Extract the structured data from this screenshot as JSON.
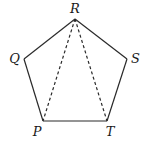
{
  "figure": {
    "type": "pentagon-diagram",
    "stroke_color": "#2a2a2a",
    "vertices": [
      {
        "label": "R",
        "x": 75,
        "y": 19,
        "lx": 75,
        "ly": 13,
        "anchor": "middle"
      },
      {
        "label": "S",
        "x": 127,
        "y": 59,
        "lx": 131,
        "ly": 63,
        "anchor": "start"
      },
      {
        "label": "T",
        "x": 107,
        "y": 121,
        "lx": 110,
        "ly": 136,
        "anchor": "middle"
      },
      {
        "label": "P",
        "x": 43,
        "y": 121,
        "lx": 37,
        "ly": 136,
        "anchor": "middle"
      },
      {
        "label": "Q",
        "x": 24,
        "y": 59,
        "lx": 20,
        "ly": 63,
        "anchor": "end"
      }
    ],
    "solid_edges": [
      [
        "R",
        "S"
      ],
      [
        "S",
        "T"
      ],
      [
        "T",
        "P"
      ],
      [
        "P",
        "Q"
      ],
      [
        "Q",
        "R"
      ]
    ],
    "dashed_edges": [
      [
        "R",
        "P"
      ],
      [
        "R",
        "T"
      ]
    ]
  }
}
